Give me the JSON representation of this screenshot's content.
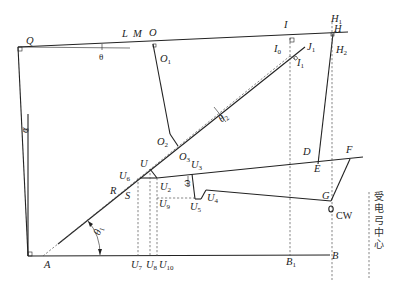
{
  "diagram": {
    "points": {
      "Q": "Q",
      "L": "L",
      "M": "M",
      "O": "O",
      "O1": "O",
      "O2": "O",
      "O3": "O",
      "I": "I",
      "I0": "I",
      "I1": "I",
      "J1": "J",
      "H": "H",
      "H1": "H",
      "H2": "H",
      "D": "D",
      "E": "E",
      "F": "F",
      "G": "G",
      "U": "U",
      "U2": "U",
      "U3": "U",
      "U4": "U",
      "U5": "U",
      "U6": "U",
      "U7": "U",
      "U8": "U",
      "U9": "U",
      "U10": "U",
      "R": "R",
      "S": "S",
      "A": "A",
      "B": "B",
      "B1": "B"
    },
    "subscripts": {
      "O1": "1",
      "O2": "2",
      "O3": "3",
      "I0": "0",
      "I1": "1",
      "J1": "1",
      "H1": "1",
      "H2": "2",
      "U2": "2",
      "U3": "3",
      "U4": "4",
      "U5": "5",
      "U6": "6",
      "U7": "7",
      "U8": "8",
      "U9": "9",
      "U10": "10",
      "B1": "1"
    },
    "angles": {
      "theta": "θ",
      "theta1": "θ",
      "theta1_sub": "1",
      "theta2": "θ",
      "theta2_sub": "2",
      "alpha": "α",
      "omega": "ω"
    },
    "cw_label": "CW",
    "vertical_caption": [
      "受",
      "电",
      "弓",
      "中",
      "心"
    ]
  }
}
